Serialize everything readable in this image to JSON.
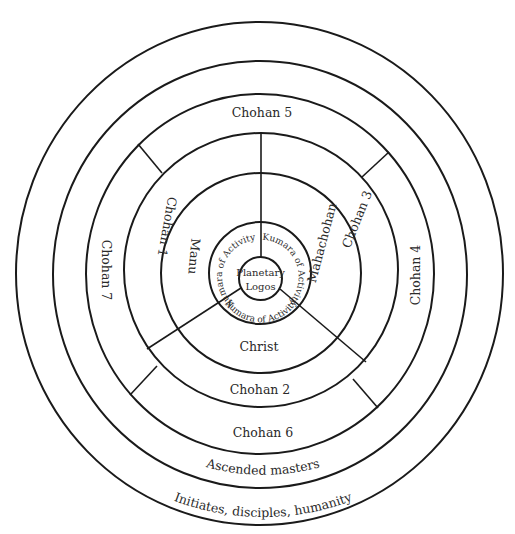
{
  "diagram": {
    "center": {
      "label_line1": "Planetary",
      "label_line2": "Logos"
    },
    "kumaras": [
      {
        "label": "Kumara of Activity",
        "position": "left"
      },
      {
        "label": "Kumara of Activity",
        "position": "right"
      },
      {
        "label": "Kumara of Activity",
        "position": "bottom"
      }
    ],
    "inner_ring": {
      "manu": "Manu",
      "mahachohan": "Mahachohan",
      "christ": "Christ"
    },
    "chohan_ring": {
      "chohan_1": "Chohan 1",
      "chohan_3": "Chohan 3",
      "chohan_2": "Chohan 2",
      "chohan_7": "Chohan 7",
      "chohan_4": "Chohan 4",
      "chohan_5": "Chohan 5",
      "chohan_6": "Chohan 6"
    },
    "outer_rings": {
      "ascended_masters": "Ascended masters",
      "humanity": "Initiates, disciples, humanity"
    },
    "colors": {
      "line": "#1a1a1a",
      "text": "#2a2a2a",
      "background": "#ffffff"
    }
  }
}
